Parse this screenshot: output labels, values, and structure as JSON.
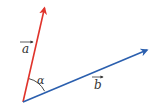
{
  "diagram": {
    "type": "vector-angle",
    "origin": {
      "x": 23,
      "y": 102
    },
    "vectors": [
      {
        "name": "a",
        "label": "a",
        "color": "#e0332b",
        "tip": {
          "x": 45,
          "y": 6
        },
        "label_pos": {
          "x": 22,
          "y": 52
        }
      },
      {
        "name": "b",
        "label": "b",
        "color": "#2b5fae",
        "tip": {
          "x": 149,
          "y": 49
        },
        "label_pos": {
          "x": 94,
          "y": 89
        }
      }
    ],
    "angle": {
      "label": "α",
      "color": "#2a2a2a",
      "label_pos": {
        "x": 37,
        "y": 84
      }
    }
  }
}
